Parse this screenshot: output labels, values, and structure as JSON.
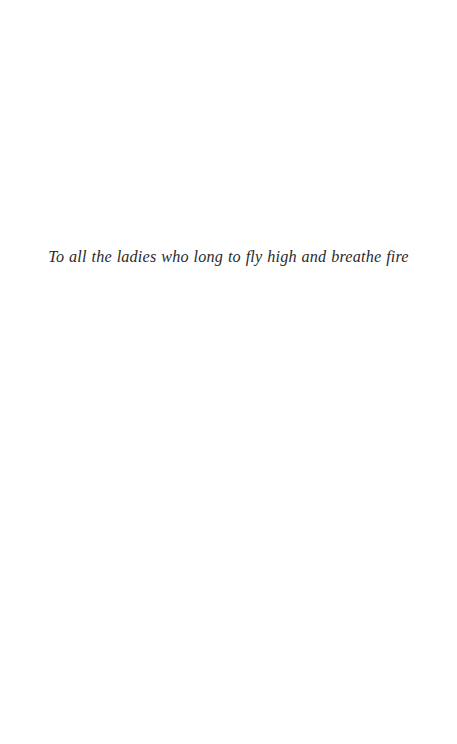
{
  "page": {
    "background_color": "#ffffff",
    "width": 457,
    "height": 744
  },
  "dedication": {
    "text": "To all the ladies who long to fly high and breathe fire",
    "style": "italic",
    "text_color": "#2a2a2e",
    "alignment": "center"
  }
}
